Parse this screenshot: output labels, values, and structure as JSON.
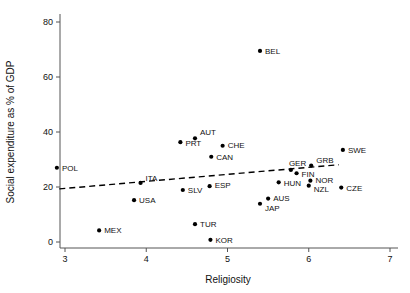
{
  "chart_data": {
    "type": "scatter",
    "title": "",
    "xlabel": "Religiosity",
    "ylabel": "Social expenditure as % of GDP",
    "xlim": [
      2.72,
      7.1
    ],
    "ylim": [
      -2,
      83
    ],
    "xticks": [
      3,
      4,
      5,
      6,
      7
    ],
    "xtick_labels": [
      "3",
      "4",
      "5",
      "6",
      "7"
    ],
    "yticks": [
      0,
      20,
      40,
      60,
      80
    ],
    "ytick_labels": [
      "0",
      "20",
      "40",
      "60",
      "80"
    ],
    "grid": false,
    "legend": null,
    "points": [
      {
        "label": "POL",
        "x": 2.9,
        "y": 27.0,
        "lx": 5,
        "ly": 3
      },
      {
        "label": "MEX",
        "x": 3.42,
        "y": 4.2,
        "lx": 5,
        "ly": 3
      },
      {
        "label": "USA",
        "x": 3.85,
        "y": 15.2,
        "lx": 5,
        "ly": 3
      },
      {
        "label": "ITA",
        "x": 3.93,
        "y": 21.5,
        "lx": 5,
        "ly": -2
      },
      {
        "label": "PRT",
        "x": 4.42,
        "y": 36.3,
        "lx": 5,
        "ly": 4
      },
      {
        "label": "SLV",
        "x": 4.45,
        "y": 18.9,
        "lx": 5,
        "ly": 3
      },
      {
        "label": "AUT",
        "x": 4.6,
        "y": 37.7,
        "lx": 5,
        "ly": -3
      },
      {
        "label": "TUR",
        "x": 4.6,
        "y": 6.5,
        "lx": 5,
        "ly": 3
      },
      {
        "label": "ESP",
        "x": 4.78,
        "y": 20.3,
        "lx": 5,
        "ly": 2
      },
      {
        "label": "KOR",
        "x": 4.79,
        "y": 0.8,
        "lx": 5,
        "ly": 3
      },
      {
        "label": "CAN",
        "x": 4.8,
        "y": 31.0,
        "lx": 5,
        "ly": 3
      },
      {
        "label": "CHE",
        "x": 4.94,
        "y": 35.0,
        "lx": 5,
        "ly": 2
      },
      {
        "label": "BEL",
        "x": 5.4,
        "y": 69.5,
        "lx": 5,
        "ly": 3
      },
      {
        "label": "JAP",
        "x": 5.4,
        "y": 13.9,
        "lx": 5,
        "ly": 7
      },
      {
        "label": "AUS",
        "x": 5.5,
        "y": 15.8,
        "lx": 5,
        "ly": 2
      },
      {
        "label": "HUN",
        "x": 5.63,
        "y": 21.7,
        "lx": 5,
        "ly": 4
      },
      {
        "label": "GER",
        "x": 5.78,
        "y": 26.2,
        "lx": -2,
        "ly": -4
      },
      {
        "label": "FIN",
        "x": 5.85,
        "y": 25.0,
        "lx": 5,
        "ly": 4
      },
      {
        "label": "NOR",
        "x": 6.02,
        "y": 22.3,
        "lx": 5,
        "ly": 2
      },
      {
        "label": "NZL",
        "x": 6.0,
        "y": 20.5,
        "lx": 5,
        "ly": 6
      },
      {
        "label": "GRB",
        "x": 6.03,
        "y": 27.8,
        "lx": 5,
        "ly": -3
      },
      {
        "label": "CZE",
        "x": 6.4,
        "y": 19.8,
        "lx": 5,
        "ly": 3
      },
      {
        "label": "SWE",
        "x": 6.42,
        "y": 33.5,
        "lx": 5,
        "ly": 3
      }
    ],
    "trend": {
      "x0": 2.93,
      "y0": 19.3,
      "x1": 6.37,
      "y1": 28.1,
      "style": "dashed"
    }
  }
}
